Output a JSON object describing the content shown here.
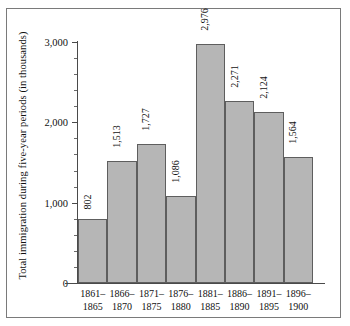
{
  "chart_data": {
    "type": "bar",
    "title": "",
    "subtitle": "",
    "xlabel": "",
    "ylabel": "Total immigration during five-year periods (in thousands)",
    "categories": [
      "1861–1865",
      "1866–1870",
      "1871–1875",
      "1876–1880",
      "1881–1885",
      "1886–1890",
      "1891–1895",
      "1896–1900"
    ],
    "category_lines": [
      [
        "1861–",
        "1865"
      ],
      [
        "1866–",
        "1870"
      ],
      [
        "1871–",
        "1875"
      ],
      [
        "1876–",
        "1880"
      ],
      [
        "1881–",
        "1885"
      ],
      [
        "1886–",
        "1890"
      ],
      [
        "1891–",
        "1895"
      ],
      [
        "1896–",
        "1900"
      ]
    ],
    "values": [
      802,
      1513,
      1727,
      1086,
      2976,
      2271,
      2124,
      1564
    ],
    "value_labels": [
      "802",
      "1,513",
      "1,727",
      "1,086",
      "2,976",
      "2,271",
      "2,124",
      "1,564"
    ],
    "ylim": [
      0,
      3000
    ],
    "ytick_labels": [
      "0",
      "1,000",
      "2,000",
      "3,000"
    ],
    "ytick_values": [
      0,
      1000,
      2000,
      3000
    ],
    "yminor_step": 200,
    "grid": false,
    "legend": "none",
    "bar_color": "#b6b6b6",
    "bar_edge_color": "#5e5e5e",
    "axis_color": "#4a4a4a",
    "frame_color": "#7a7a7a",
    "background": "#ffffff"
  }
}
